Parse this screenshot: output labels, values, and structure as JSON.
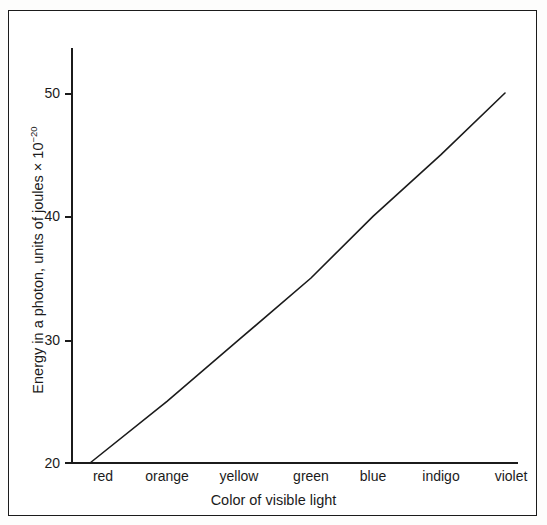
{
  "chart_data": {
    "type": "line",
    "title": "",
    "xlabel": "Color of visible light",
    "ylabel": "Energy in a photon, units of joules × 10",
    "ylabel_exponent": "−20",
    "categories": [
      "red",
      "orange",
      "yellow",
      "green",
      "blue",
      "indigo",
      "violet"
    ],
    "series": [
      {
        "name": "Photon energy",
        "values": [
          20,
          25,
          30,
          35,
          40,
          45,
          50
        ]
      }
    ],
    "ylim": [
      20,
      54
    ],
    "yticks": [
      20,
      30,
      40,
      50
    ],
    "ytick_labels": [
      "20",
      "30",
      "40",
      "50"
    ],
    "grid": false,
    "legend": false,
    "line_color": "#1b1b1b",
    "background_color": "#ffffff",
    "frame_color": "#1b1b1b",
    "annotations": []
  },
  "axes": {
    "y": {
      "ticks": [
        {
          "label": "50",
          "value": 50
        },
        {
          "label": "40",
          "value": 40
        },
        {
          "label": "30",
          "value": 30
        },
        {
          "label": "20",
          "value": 20
        }
      ],
      "title_main": "Energy in a photon, units of joules × 10",
      "title_exponent": "−20"
    },
    "x": {
      "ticks": [
        {
          "label": "red"
        },
        {
          "label": "orange"
        },
        {
          "label": "yellow"
        },
        {
          "label": "green"
        },
        {
          "label": "blue"
        },
        {
          "label": "indigo"
        },
        {
          "label": "violet"
        }
      ],
      "title": "Color of visible light"
    }
  }
}
